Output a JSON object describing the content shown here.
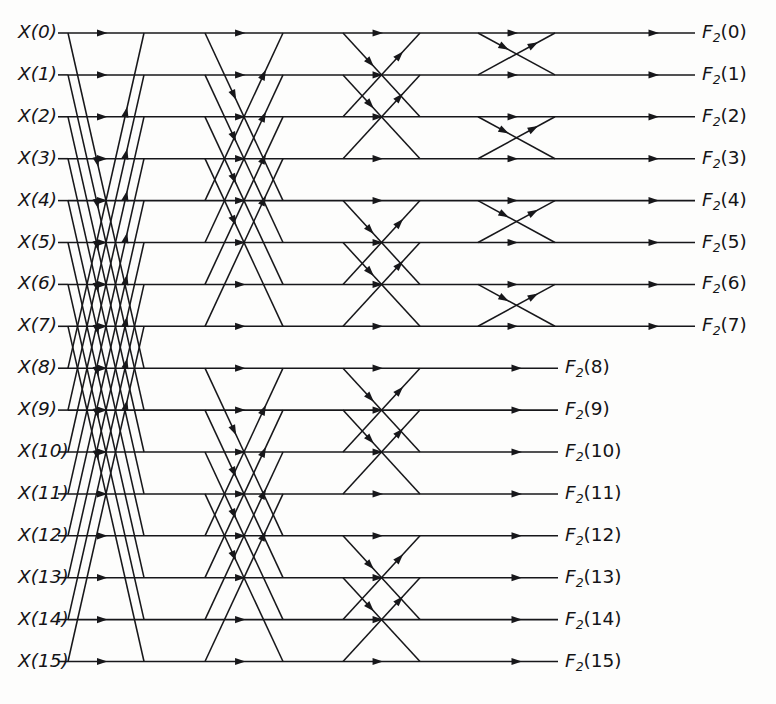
{
  "figure": {
    "name": "fft-butterfly-signal-flow-graph",
    "type": "signal-flow-graph",
    "background_color": "#fdfdfc",
    "line_color": "#17171a",
    "width": 776,
    "height": 704,
    "n_points": 16,
    "n_stages": 4,
    "stage_spans": [
      8,
      4,
      2,
      1
    ],
    "row_count": 16,
    "row_top_y": 33,
    "row_spacing": 41.9,
    "stages": [
      {
        "index": 1,
        "x_start": 68,
        "x_end": 144,
        "span": 8,
        "rows_covered": [
          0,
          15
        ]
      },
      {
        "index": 2,
        "x_start": 205,
        "x_end": 283,
        "span": 4,
        "rows_covered": [
          0,
          15
        ]
      },
      {
        "index": 3,
        "x_start": 343,
        "x_end": 420,
        "span": 2,
        "rows_covered": [
          0,
          15
        ]
      },
      {
        "index": 4,
        "x_start": 478,
        "x_end": 555,
        "span": 1,
        "rows_covered": [
          0,
          7
        ]
      }
    ],
    "output_arrows": {
      "upper_rows": {
        "rows": [
          0,
          1,
          2,
          3,
          4,
          5,
          6,
          7
        ],
        "x_start": 615,
        "x_end": 695,
        "label_x": 702
      },
      "lower_rows": {
        "rows": [
          8,
          9,
          10,
          11,
          12,
          13,
          14,
          15
        ],
        "x_start": 478,
        "x_end": 558,
        "label_x": 565
      }
    },
    "input_label_x": 18
  },
  "inputs": {
    "prefix": "X",
    "items": [
      {
        "index": 0,
        "text": "X(0)"
      },
      {
        "index": 1,
        "text": "X(1)"
      },
      {
        "index": 2,
        "text": "X(2)"
      },
      {
        "index": 3,
        "text": "X(3)"
      },
      {
        "index": 4,
        "text": "X(4)"
      },
      {
        "index": 5,
        "text": "X(5)"
      },
      {
        "index": 6,
        "text": "X(6)"
      },
      {
        "index": 7,
        "text": "X(7)"
      },
      {
        "index": 8,
        "text": "X(8)"
      },
      {
        "index": 9,
        "text": "X(9)"
      },
      {
        "index": 10,
        "text": "X(10)"
      },
      {
        "index": 11,
        "text": "X(11)"
      },
      {
        "index": 12,
        "text": "X(12)"
      },
      {
        "index": 13,
        "text": "X(13)"
      },
      {
        "index": 14,
        "text": "X(14)"
      },
      {
        "index": 15,
        "text": "X(15)"
      }
    ]
  },
  "outputs": {
    "prefix": "F",
    "subscript": "2",
    "items": [
      {
        "index": 0,
        "arg": "(0)",
        "text": "F2(0)"
      },
      {
        "index": 1,
        "arg": "(1)",
        "text": "F2(1)"
      },
      {
        "index": 2,
        "arg": "(2)",
        "text": "F2(2)"
      },
      {
        "index": 3,
        "arg": "(3)",
        "text": "F2(3)"
      },
      {
        "index": 4,
        "arg": "(4)",
        "text": "F2(4)"
      },
      {
        "index": 5,
        "arg": "(5)",
        "text": "F2(5)"
      },
      {
        "index": 6,
        "arg": "(6)",
        "text": "F2(6)"
      },
      {
        "index": 7,
        "arg": "(7)",
        "text": "F2(7)"
      },
      {
        "index": 8,
        "arg": "(8)",
        "text": "F2(8)"
      },
      {
        "index": 9,
        "arg": "(9)",
        "text": "F2(9)"
      },
      {
        "index": 10,
        "arg": "(10)",
        "text": "F2(10)"
      },
      {
        "index": 11,
        "arg": "(11)",
        "text": "F2(11)"
      },
      {
        "index": 12,
        "arg": "(12)",
        "text": "F2(12)"
      },
      {
        "index": 13,
        "arg": "(13)",
        "text": "F2(13)"
      },
      {
        "index": 14,
        "arg": "(14)",
        "text": "F2(14)"
      },
      {
        "index": 15,
        "arg": "(15)",
        "text": "F2(15)"
      }
    ]
  }
}
